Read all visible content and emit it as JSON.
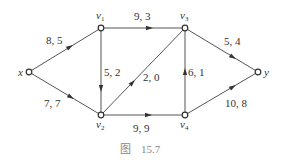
{
  "diagram": {
    "type": "directed-flow-network",
    "nodes": [
      {
        "id": "x",
        "label": "x",
        "sub": "",
        "cx": 29,
        "cy": 72
      },
      {
        "id": "v1",
        "label": "v",
        "sub": "1",
        "cx": 101,
        "cy": 28
      },
      {
        "id": "v2",
        "label": "v",
        "sub": "2",
        "cx": 101,
        "cy": 115
      },
      {
        "id": "v3",
        "label": "v",
        "sub": "3",
        "cx": 185,
        "cy": 28
      },
      {
        "id": "v4",
        "label": "v",
        "sub": "4",
        "cx": 185,
        "cy": 115
      },
      {
        "id": "y",
        "label": "y",
        "sub": "",
        "cx": 258,
        "cy": 72
      }
    ],
    "edges": [
      {
        "from": "x",
        "to": "v1",
        "label": "8, 5"
      },
      {
        "from": "x",
        "to": "v2",
        "label": "7, 7"
      },
      {
        "from": "v1",
        "to": "v3",
        "label": "9, 3"
      },
      {
        "from": "v1",
        "to": "v2",
        "label": "5, 2"
      },
      {
        "from": "v2",
        "to": "v3",
        "label": "2, 0"
      },
      {
        "from": "v4",
        "to": "v3",
        "label": "6, 1"
      },
      {
        "from": "v2",
        "to": "v4",
        "label": "9, 9"
      },
      {
        "from": "v3",
        "to": "y",
        "label": "5, 4"
      },
      {
        "from": "v4",
        "to": "y",
        "label": "10, 8"
      }
    ],
    "caption": {
      "prefix": "图",
      "number": "15.7"
    }
  }
}
